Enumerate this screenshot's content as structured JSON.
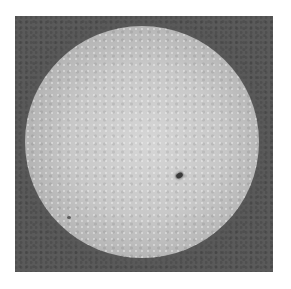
{
  "image": {
    "subject": "grayscale solar disk photograph",
    "features": [
      "sun-disk",
      "sunspot"
    ],
    "colors": {
      "background": "#ffffff",
      "frame": "#5a5a5a",
      "disk_center": "#d6d6d6",
      "disk_limb": "#6e6e6e",
      "sunspot": "#3a3a3a"
    }
  }
}
